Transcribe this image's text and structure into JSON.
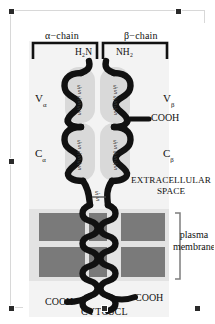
{
  "figure": {
    "background": "#ffffff"
  },
  "chains": {
    "alpha_label": "α−chain",
    "beta_label": "β−chain"
  },
  "termini": {
    "alpha_n_terminus": "H₂N",
    "beta_n_terminus": "NH₂",
    "beta_c_terminus_extracellular": "COOH",
    "alpha_c_terminus_cytosolic": "COOH",
    "beta_c_terminus_cytosolic": "COOH"
  },
  "domains": {
    "v_alpha": "V",
    "v_alpha_sub": "α",
    "v_beta": "V",
    "v_beta_sub": "β",
    "c_alpha": "C",
    "c_alpha_sub": "α",
    "c_beta": "C",
    "c_beta_sub": "β"
  },
  "compartments": {
    "extracellular": "EXTRACELLULAR SPACE",
    "membrane": "plasma membrane",
    "cytosol": "CYTOSCL"
  },
  "bonds": {
    "disulfide_label": "S-S",
    "count": 5
  },
  "colors": {
    "protein_stroke": "#111111",
    "domain_fill": "#d9d9d9",
    "membrane_fill": "#7a7a7a",
    "membrane_band": "#e0e0e0",
    "panel_wash": "#f0f0f0",
    "selection_border": "#d8d8d8",
    "handle": "#2a2a2a"
  }
}
